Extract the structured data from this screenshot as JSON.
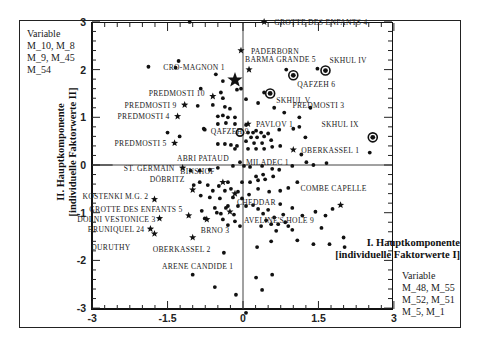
{
  "chart_data": {
    "type": "scatter",
    "title": "",
    "xlabel": "I. Hauptkomponente [individuelle Faktorwerte I]",
    "ylabel": "II. Hauptkomponente [individuelle Faktorwerte II]",
    "xlim": [
      -3,
      3
    ],
    "ylim": [
      -3,
      3
    ],
    "x_ticks": [
      "-3",
      "-1.5",
      "0",
      "1.5",
      "3"
    ],
    "y_ticks": [
      "-3",
      "-2",
      "-1",
      "0",
      "1",
      "2",
      "3"
    ],
    "reference_lines": {
      "x": 0,
      "y": 0
    },
    "y_variables_label": "Variable",
    "y_variables": [
      "M_10, M_8",
      "M_9, M_45",
      "M_54"
    ],
    "x_variables_label": "Variable",
    "x_variables": [
      "M_48, M_55",
      "M_52, M_51",
      "M_5, M_1"
    ],
    "legend": {
      "dot": "individual specimen",
      "star": "labelled specimen",
      "circled_dot": "Skhul/Qafzeh specimen",
      "open_circle": "centroid"
    },
    "labelled_points": [
      {
        "label": "Grotte des Enfants 4",
        "x": 0.42,
        "y": 3.0,
        "marker": "star"
      },
      {
        "label": "Paderborn",
        "x": -0.04,
        "y": 2.4,
        "marker": "star"
      },
      {
        "label": "Barma Grande 5",
        "x": 0.12,
        "y": 2.0,
        "marker": "star"
      },
      {
        "label": "Skhul IV",
        "x": 1.64,
        "y": 1.98,
        "marker": "circled_dot"
      },
      {
        "label": "Qafzeh 6",
        "x": 1.0,
        "y": 1.88,
        "marker": "circled_dot"
      },
      {
        "label": "Cro-Magnon 1",
        "x": -0.16,
        "y": 1.78,
        "marker": "star_large"
      },
      {
        "label": "Predmosti 10",
        "x": -0.6,
        "y": 1.44,
        "marker": "star"
      },
      {
        "label": "Skhul V",
        "x": 0.54,
        "y": 1.5,
        "marker": "circled_dot"
      },
      {
        "label": "Predmosti 9",
        "x": -1.16,
        "y": 1.26,
        "marker": "star"
      },
      {
        "label": "Predmosti 3",
        "x": 1.34,
        "y": 1.2,
        "marker": "dot"
      },
      {
        "label": "Predmosti 4",
        "x": -1.3,
        "y": 1.02,
        "marker": "star"
      },
      {
        "label": "Pavlov 1",
        "x": 0.1,
        "y": 0.86,
        "marker": "star"
      },
      {
        "label": "Skhul IX",
        "x": 2.58,
        "y": 0.58,
        "marker": "circled_dot"
      },
      {
        "label": "Qafzeh 9",
        "x": -0.76,
        "y": 0.74,
        "marker": "dot"
      },
      {
        "label": "Oberkassel 1",
        "x": 1.0,
        "y": 0.32,
        "marker": "star"
      },
      {
        "label": "Abri Pataud",
        "x": -0.16,
        "y": 0.34,
        "marker": "dot"
      },
      {
        "label": "Predmosti 5",
        "x": -1.36,
        "y": 0.46,
        "marker": "star"
      },
      {
        "label": "Miladec 1",
        "x": -0.06,
        "y": 0.06,
        "marker": "dot"
      },
      {
        "label": "St. Germain",
        "x": -1.2,
        "y": -0.06,
        "marker": "star"
      },
      {
        "label": "Combe Capelle",
        "x": 1.94,
        "y": -0.84,
        "marker": "star"
      },
      {
        "label": "Binshof",
        "x": -0.4,
        "y": -0.36,
        "marker": "star"
      },
      {
        "label": "Cheddar",
        "x": -0.16,
        "y": -0.6,
        "marker": "star"
      },
      {
        "label": "Döbritz",
        "x": -1.0,
        "y": -0.52,
        "marker": "star"
      },
      {
        "label": "Kostenki M.G. 2",
        "x": -1.76,
        "y": -0.72,
        "marker": "star"
      },
      {
        "label": "Aveline's Hole 9",
        "x": -0.26,
        "y": -0.98,
        "marker": "star"
      },
      {
        "label": "Grotte des Enfants 5",
        "x": -1.08,
        "y": -1.06,
        "marker": "star"
      },
      {
        "label": "Dolni Vestonice 3",
        "x": -1.66,
        "y": -1.12,
        "marker": "star"
      },
      {
        "label": "Brno 3",
        "x": -0.72,
        "y": -1.14,
        "marker": "star"
      },
      {
        "label": "Bruniquel 24",
        "x": -1.84,
        "y": -1.34,
        "marker": "star"
      },
      {
        "label": "Duruthy",
        "x": -1.76,
        "y": -1.44,
        "marker": "star"
      },
      {
        "label": "Oberkassel 2",
        "x": -1.0,
        "y": -1.52,
        "marker": "star"
      },
      {
        "label": "Arene Candide 1",
        "x": -0.38,
        "y": -1.84,
        "marker": "dot"
      }
    ],
    "centroid": {
      "x": -0.06,
      "y": 0.68
    },
    "unlabelled_points": [
      [
        -1.06,
        3.0
      ],
      [
        -1.28,
        2.18
      ],
      [
        -1.88,
        2.06
      ],
      [
        -1.34,
        2.04
      ],
      [
        -0.54,
        1.9
      ],
      [
        0.86,
        2.0
      ],
      [
        1.48,
        2.02
      ],
      [
        -0.4,
        1.76
      ],
      [
        -0.84,
        1.6
      ],
      [
        0.42,
        1.52
      ],
      [
        -0.9,
        1.24
      ],
      [
        -0.6,
        1.26
      ],
      [
        -0.44,
        1.52
      ],
      [
        -0.12,
        1.58
      ],
      [
        -0.04,
        1.6
      ],
      [
        0.06,
        1.38
      ],
      [
        0.3,
        1.3
      ],
      [
        -0.4,
        1.4
      ],
      [
        -0.36,
        1.22
      ],
      [
        -0.26,
        1.18
      ],
      [
        -0.5,
        1.02
      ],
      [
        -0.4,
        1.04
      ],
      [
        -0.3,
        1.0
      ],
      [
        -0.16,
        1.0
      ],
      [
        -0.5,
        0.86
      ],
      [
        -0.34,
        0.88
      ],
      [
        -0.16,
        0.86
      ],
      [
        0.06,
        0.84
      ],
      [
        -1.5,
        0.68
      ],
      [
        -1.26,
        0.6
      ],
      [
        -0.78,
        0.76
      ],
      [
        -0.5,
        0.44
      ],
      [
        -0.36,
        0.44
      ],
      [
        -0.24,
        0.42
      ],
      [
        -0.12,
        0.4
      ],
      [
        0.1,
        0.68
      ],
      [
        0.2,
        0.68
      ],
      [
        0.26,
        0.72
      ],
      [
        0.36,
        0.68
      ],
      [
        0.5,
        0.66
      ],
      [
        0.72,
        0.74
      ],
      [
        1.0,
        0.76
      ],
      [
        0.16,
        0.58
      ],
      [
        0.28,
        0.58
      ],
      [
        0.42,
        0.6
      ],
      [
        0.56,
        0.52
      ],
      [
        0.06,
        0.5
      ],
      [
        0.22,
        0.46
      ],
      [
        0.38,
        0.46
      ],
      [
        0.58,
        0.38
      ],
      [
        0.74,
        0.4
      ],
      [
        0.1,
        0.34
      ],
      [
        0.26,
        0.34
      ],
      [
        0.42,
        0.34
      ],
      [
        1.24,
        0.58
      ],
      [
        1.16,
        0.22
      ],
      [
        1.26,
        0.06
      ],
      [
        1.4,
        0.0
      ],
      [
        1.66,
        0.04
      ],
      [
        2.52,
        0.26
      ],
      [
        1.12,
        0.8
      ],
      [
        1.12,
        1.0
      ],
      [
        0.62,
        1.2
      ],
      [
        0.82,
        1.1
      ],
      [
        -1.04,
        -0.12
      ],
      [
        -0.86,
        -0.12
      ],
      [
        -0.66,
        -0.1
      ],
      [
        -0.5,
        -0.06
      ],
      [
        -0.2,
        -0.02
      ],
      [
        0.02,
        -0.02
      ],
      [
        0.14,
        -0.04
      ],
      [
        0.38,
        -0.02
      ],
      [
        0.58,
        -0.08
      ],
      [
        0.72,
        -0.1
      ],
      [
        0.98,
        -0.02
      ],
      [
        0.6,
        -0.24
      ],
      [
        0.4,
        -0.2
      ],
      [
        0.26,
        -0.24
      ],
      [
        1.08,
        -0.36
      ],
      [
        0.44,
        -0.3
      ],
      [
        0.3,
        -0.32
      ],
      [
        0.14,
        -0.36
      ],
      [
        -0.02,
        -0.36
      ],
      [
        -0.3,
        -0.36
      ],
      [
        -0.86,
        -0.36
      ],
      [
        -0.98,
        -0.42
      ],
      [
        -0.7,
        -0.42
      ],
      [
        -0.6,
        -0.54
      ],
      [
        -0.48,
        -0.44
      ],
      [
        -0.36,
        -0.54
      ],
      [
        -0.24,
        -0.5
      ],
      [
        -0.1,
        -0.56
      ],
      [
        -0.2,
        -0.68
      ],
      [
        -0.02,
        -0.7
      ],
      [
        0.12,
        -0.62
      ],
      [
        0.3,
        -0.5
      ],
      [
        0.52,
        -0.56
      ],
      [
        0.74,
        -0.54
      ],
      [
        0.9,
        -0.48
      ],
      [
        -0.84,
        -0.64
      ],
      [
        -0.66,
        -0.68
      ],
      [
        -0.46,
        -0.7
      ],
      [
        -0.3,
        -0.86
      ],
      [
        -0.1,
        -0.86
      ],
      [
        0.06,
        -0.86
      ],
      [
        0.2,
        -0.84
      ],
      [
        -0.56,
        -0.9
      ],
      [
        -0.34,
        -0.9
      ],
      [
        -0.44,
        -1.02
      ],
      [
        -0.18,
        -1.04
      ],
      [
        -0.4,
        -1.14
      ],
      [
        -0.16,
        -1.18
      ],
      [
        -0.3,
        -1.26
      ],
      [
        -0.06,
        -1.28
      ],
      [
        0.3,
        -0.92
      ],
      [
        0.5,
        -0.94
      ],
      [
        0.74,
        -0.82
      ],
      [
        0.8,
        -1.04
      ],
      [
        0.62,
        -1.1
      ],
      [
        0.98,
        -0.9
      ],
      [
        1.44,
        -0.98
      ],
      [
        1.18,
        -1.06
      ],
      [
        1.64,
        -1.06
      ],
      [
        1.56,
        -1.32
      ],
      [
        1.78,
        -0.92
      ],
      [
        0.4,
        -1.02
      ],
      [
        0.46,
        -1.16
      ],
      [
        0.36,
        -1.28
      ],
      [
        0.7,
        -1.24
      ],
      [
        0.84,
        -1.2
      ],
      [
        0.9,
        -1.28
      ],
      [
        0.98,
        -1.36
      ],
      [
        1.08,
        -1.58
      ],
      [
        1.4,
        -1.66
      ],
      [
        1.72,
        -1.66
      ],
      [
        2.02,
        -1.72
      ],
      [
        2.0,
        -1.52
      ],
      [
        0.56,
        -1.24
      ],
      [
        0.66,
        -1.38
      ],
      [
        0.56,
        -1.6
      ],
      [
        0.28,
        -1.72
      ],
      [
        -1.0,
        -2.3
      ],
      [
        -0.56,
        -2.56
      ],
      [
        0.26,
        -2.36
      ],
      [
        0.58,
        -2.3
      ],
      [
        0.06,
        -3.1
      ],
      [
        0.38,
        -2.62
      ],
      [
        -0.14,
        -2.72
      ],
      [
        -0.52,
        -1.0
      ],
      [
        -0.82,
        -0.96
      ],
      [
        -0.76,
        -1.12
      ]
    ]
  },
  "caption_partial": ""
}
